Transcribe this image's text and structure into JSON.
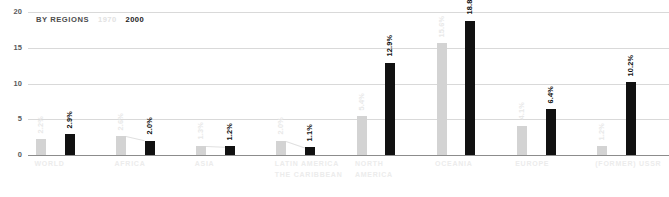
{
  "legend": {
    "title": "BY REGIONS",
    "series_old": "1970",
    "series_new": "2000"
  },
  "axis": {
    "y_ticks": [
      "0",
      "5",
      "10",
      "15",
      "20"
    ]
  },
  "chart_data": {
    "type": "bar",
    "title": "BY REGIONS",
    "xlabel": "",
    "ylabel": "",
    "ylim": [
      0,
      20
    ],
    "grid": true,
    "legend_position": "top-left",
    "categories": [
      "WORLD",
      "AFRICA",
      "ASIA",
      "LATIN AMERICA THE CARIBBEAN",
      "NORTH AMERICA",
      "OCEANIA",
      "EUROPE",
      "(FORMER) USSR"
    ],
    "category_lines": [
      [
        "WORLD",
        ""
      ],
      [
        "AFRICA",
        ""
      ],
      [
        "ASIA",
        ""
      ],
      [
        "LATIN AMERICA",
        "THE CARIBBEAN"
      ],
      [
        "NORTH",
        "AMERICA"
      ],
      [
        "OCEANIA",
        ""
      ],
      [
        "EUROPE",
        ""
      ],
      [
        "(FORMER) USSR",
        ""
      ]
    ],
    "series": [
      {
        "name": "1970",
        "color": "#d3d3d3",
        "values": [
          2.2,
          2.6,
          1.3,
          2.0,
          5.4,
          15.6,
          4.1,
          1.2
        ],
        "labels": [
          "2.2%",
          "2.6%",
          "1.3%",
          "2.0%",
          "5.4%",
          "15.6%",
          "4.1%",
          "1.2%"
        ]
      },
      {
        "name": "2000",
        "color": "#111111",
        "values": [
          2.9,
          2.0,
          1.2,
          1.1,
          12.9,
          18.8,
          6.4,
          10.2
        ],
        "labels": [
          "2.9%",
          "2.0%",
          "1.2%",
          "1.1%",
          "12.9%",
          "18.8%",
          "6.4%",
          "10.2%"
        ]
      }
    ]
  }
}
